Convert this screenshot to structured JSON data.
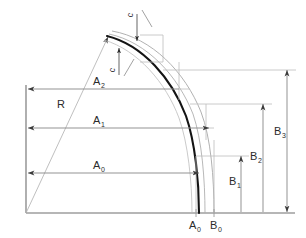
{
  "diagram": {
    "type": "engineering-dimension-drawing",
    "title": "",
    "colors": {
      "profile_main": "#1a1a1a",
      "profile_offset": "#9a9a9a",
      "dimension_line": "#7d7d7d",
      "axis": "#6e6e6e",
      "construction": "#b5b5b5",
      "text": "#2b2b2b",
      "background": "#ffffff"
    },
    "labels": {
      "radius": "R",
      "thickness_upper": "c",
      "thickness_lower": "c",
      "a0": "A",
      "a0_sub": "0",
      "a1": "A",
      "a1_sub": "1",
      "a2": "A",
      "a2_sub": "2",
      "b0": "B",
      "b0_sub": "0",
      "b1": "B",
      "b1_sub": "1",
      "b2": "B",
      "b2_sub": "2",
      "b3": "B",
      "b3_sub": "3",
      "baseline_a0": "A",
      "baseline_a0_sub": "0",
      "baseline_b0": "B",
      "baseline_b0_sub": "0"
    },
    "dimensions": {
      "horizontal": [
        {
          "name": "A2",
          "y": 89,
          "x_from": 26,
          "x_to": 179,
          "label_x": 99,
          "label_y": 85
        },
        {
          "name": "A1",
          "y": 128,
          "x_from": 26,
          "x_to": 206,
          "label_x": 99,
          "label_y": 124
        },
        {
          "name": "A0",
          "y": 173,
          "x_from": 26,
          "x_to": 196,
          "label_x": 99,
          "label_y": 169
        }
      ],
      "vertical": [
        {
          "name": "B1",
          "x": 241,
          "y_from": 156,
          "y_to": 213,
          "label_x": 232,
          "label_y": 182
        },
        {
          "name": "B2",
          "x": 263,
          "y_from": 104,
          "y_to": 213,
          "label_x": 253,
          "label_y": 157
        },
        {
          "name": "B3",
          "x": 287,
          "y_from": 70,
          "y_to": 213,
          "label_x": 277,
          "label_y": 132
        }
      ]
    },
    "geometry": {
      "origin_x": 26,
      "origin_y": 213,
      "baseline_x_end": 295,
      "axis_y_top": 85,
      "apex_x": 107,
      "apex_y": 36,
      "bottom_x": 203,
      "bottom_y": 213
    }
  }
}
